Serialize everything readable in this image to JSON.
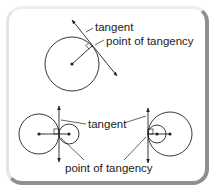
{
  "colors": {
    "ink": "#222222",
    "frame_light": "#eeeeee",
    "frame_shadow": "#8f8f8f",
    "background": "#ffffff"
  },
  "top_diagram": {
    "label_tangent": "tangent",
    "label_point": "point of tangency"
  },
  "bottom_diagram": {
    "label_tangent": "tangent",
    "label_point": "point of tangency"
  }
}
